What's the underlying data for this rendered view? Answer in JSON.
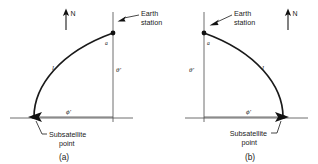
{
  "figure": {
    "panels": [
      {
        "id": "a",
        "caption": "(a)",
        "north_label": "N",
        "earth_station_label": "Earth\nstation",
        "earth_station_line1": "Earth",
        "earth_station_line2": "station",
        "subsatellite_line1": "Subsatellite",
        "subsatellite_line2": "point",
        "arc_length_symbol": "l",
        "polar_angle_symbol": "θ'",
        "azimuth_angle_symbol": "ϕ'",
        "vertex_angle_symbol": "a",
        "earth_station_position": "top-right",
        "subsatellite_position": "bottom-left"
      },
      {
        "id": "b",
        "caption": "(b)",
        "north_label": "N",
        "earth_station_label": "Earth\nstation",
        "earth_station_line1": "Earth",
        "earth_station_line2": "station",
        "subsatellite_line1": "Subsatellite",
        "subsatellite_line2": "point",
        "arc_length_symbol": "l",
        "polar_angle_symbol": "θ'",
        "azimuth_angle_symbol": "ϕ'",
        "vertex_angle_symbol": "a",
        "earth_station_position": "top-left",
        "subsatellite_position": "bottom-right"
      }
    ],
    "colors": {
      "ink": "#1a1a1a",
      "axis": "#4a4a4a",
      "background": "#ffffff"
    }
  }
}
